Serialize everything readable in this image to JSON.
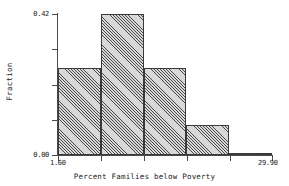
{
  "chart_data": {
    "type": "bar",
    "title": "",
    "subtitle": "",
    "xlabel": "Percent Families below Poverty",
    "ylabel": "Fraction",
    "xlim": [
      1.6,
      29.9
    ],
    "ylim": [
      0.0,
      0.42
    ],
    "grid": false,
    "legend": "none",
    "y_ticks": [
      {
        "value": 0.0,
        "label": "0.00",
        "major": true
      },
      {
        "value": 0.105,
        "label": "",
        "major": false
      },
      {
        "value": 0.21,
        "label": "",
        "major": false
      },
      {
        "value": 0.315,
        "label": "",
        "major": false
      },
      {
        "value": 0.42,
        "label": "0.42",
        "major": true
      }
    ],
    "x_ticks": [
      {
        "value": 1.6,
        "label": "1.60",
        "major": true
      },
      {
        "value": 7.26,
        "label": "",
        "major": false
      },
      {
        "value": 12.92,
        "label": "",
        "major": false
      },
      {
        "value": 18.58,
        "label": "",
        "major": false
      },
      {
        "value": 24.24,
        "label": "",
        "major": false
      },
      {
        "value": 29.9,
        "label": "29.90",
        "major": true
      }
    ],
    "bin_edges": [
      1.6,
      7.26,
      12.92,
      18.58,
      24.24,
      29.9
    ],
    "categories": [
      "1.60-7.26",
      "7.26-12.92",
      "12.92-18.58",
      "18.58-24.24",
      "24.24-29.90"
    ],
    "values": [
      0.26,
      0.42,
      0.26,
      0.09,
      0.005
    ],
    "bar_fill": "hatch-45",
    "bar_edge_color": "#3a3a3a",
    "axis_color": "#4a4a4a",
    "background": "#ffffff"
  }
}
